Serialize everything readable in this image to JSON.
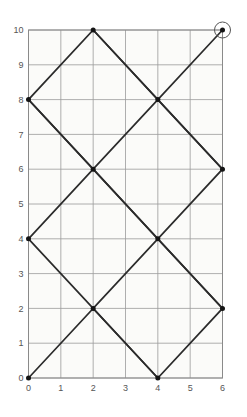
{
  "chart_data": {
    "type": "line",
    "title": "",
    "subtitle": "",
    "xlabel": "",
    "ylabel": "",
    "xlim": [
      0,
      6
    ],
    "ylim": [
      0,
      10
    ],
    "xticks": [
      0,
      1,
      2,
      3,
      4,
      5,
      6
    ],
    "yticks": [
      0,
      1,
      2,
      3,
      4,
      5,
      6,
      7,
      8,
      9,
      10
    ],
    "xtick_labels": [
      "0",
      "1",
      "2",
      "3",
      "4",
      "5",
      "6"
    ],
    "ytick_labels": [
      "0",
      "1",
      "2",
      "3",
      "4",
      "5",
      "6",
      "7",
      "8",
      "9",
      "10"
    ],
    "grid": true,
    "grid_color": "#9a9a9a",
    "background_color": "#fbfbf9",
    "legend": null,
    "series": [
      {
        "name": "billiard-path",
        "line_color": "#2b2b2b",
        "marker": "circle",
        "marker_color": "#1a1a1a",
        "points": [
          [
            0,
            0
          ],
          [
            2,
            2
          ],
          [
            4,
            0
          ],
          [
            6,
            2
          ],
          [
            4,
            4
          ],
          [
            2,
            6
          ],
          [
            0,
            8
          ],
          [
            2,
            10
          ],
          [
            4,
            8
          ],
          [
            6,
            6
          ],
          [
            4,
            4
          ],
          [
            2,
            2
          ]
        ],
        "vertices": [
          [
            0,
            0
          ],
          [
            2,
            2
          ],
          [
            4,
            0
          ],
          [
            6,
            2
          ],
          [
            4,
            4
          ],
          [
            2,
            6
          ],
          [
            0,
            8
          ],
          [
            2,
            10
          ],
          [
            4,
            8
          ],
          [
            6,
            6
          ]
        ]
      },
      {
        "name": "second-reflection-path",
        "line_color": "#2b2b2b",
        "marker": "circle",
        "marker_color": "#1a1a1a",
        "points": [
          [
            0,
            4
          ],
          [
            2,
            6
          ],
          [
            4,
            8
          ],
          [
            6,
            10
          ]
        ],
        "vertices": [
          [
            0,
            4
          ],
          [
            2,
            6
          ],
          [
            4,
            8
          ],
          [
            6,
            10
          ]
        ]
      },
      {
        "name": "descending-path-a",
        "line_color": "#2b2b2b",
        "marker": "circle",
        "marker_color": "#1a1a1a",
        "points": [
          [
            0,
            8
          ],
          [
            2,
            6
          ],
          [
            4,
            4
          ],
          [
            6,
            2
          ]
        ],
        "vertices": [
          [
            0,
            8
          ],
          [
            2,
            6
          ],
          [
            4,
            4
          ],
          [
            6,
            2
          ]
        ]
      },
      {
        "name": "descending-path-b",
        "line_color": "#2b2b2b",
        "marker": "circle",
        "marker_color": "#1a1a1a",
        "points": [
          [
            0,
            4
          ],
          [
            2,
            2
          ],
          [
            4,
            0
          ]
        ],
        "vertices": [
          [
            0,
            4
          ],
          [
            2,
            2
          ],
          [
            4,
            0
          ]
        ]
      },
      {
        "name": "descending-path-c",
        "line_color": "#2b2b2b",
        "marker": "circle",
        "marker_color": "#1a1a1a",
        "points": [
          [
            2,
            10
          ],
          [
            4,
            8
          ],
          [
            6,
            6
          ]
        ],
        "vertices": [
          [
            2,
            10
          ],
          [
            4,
            8
          ],
          [
            6,
            6
          ]
        ]
      }
    ],
    "highlight": {
      "name": "endpoint-highlight",
      "point": [
        6,
        10
      ],
      "label": "",
      "circle_radius_px": 8,
      "circle_color": "#555555"
    },
    "markers": [
      [
        0,
        0
      ],
      [
        2,
        2
      ],
      [
        4,
        0
      ],
      [
        6,
        2
      ],
      [
        0,
        4
      ],
      [
        4,
        4
      ],
      [
        2,
        6
      ],
      [
        6,
        6
      ],
      [
        0,
        8
      ],
      [
        4,
        8
      ],
      [
        2,
        10
      ],
      [
        6,
        10
      ]
    ]
  }
}
